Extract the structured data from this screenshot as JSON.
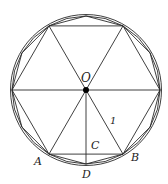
{
  "diagram": {
    "center": {
      "x": 86,
      "y": 90
    },
    "radius": 74,
    "stroke_color": "#2a2a2a",
    "labels": {
      "O": "O",
      "A": "A",
      "B": "B",
      "C": "C",
      "D": "D",
      "radius_label": "1"
    },
    "polygons": [
      {
        "name": "hexagon",
        "sides": 6
      },
      {
        "name": "dodecagon",
        "sides": 12
      },
      {
        "name": "icositetragon",
        "sides": 24
      }
    ]
  }
}
